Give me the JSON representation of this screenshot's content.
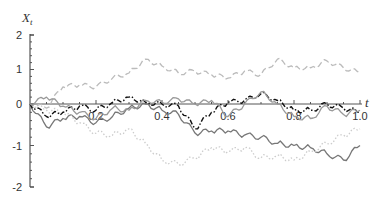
{
  "chart_data": {
    "type": "line",
    "title": "",
    "xlabel": "t",
    "ylabel": "X_t",
    "ylabel_main": "X",
    "ylabel_sub": "t",
    "xlim": [
      0,
      1.0
    ],
    "ylim": [
      -2,
      2
    ],
    "x_ticks": [
      "0.2",
      "0.4",
      "0.6",
      "0.8",
      "1.0"
    ],
    "y_ticks": [
      "2",
      "1",
      "0",
      "-1",
      "-2"
    ],
    "grid": false,
    "legend": "none",
    "x": [
      0,
      0.05,
      0.1,
      0.15,
      0.2,
      0.25,
      0.3,
      0.35,
      0.4,
      0.45,
      0.5,
      0.55,
      0.6,
      0.65,
      0.7,
      0.75,
      0.8,
      0.85,
      0.9,
      0.95,
      1.0
    ],
    "series": [
      {
        "name": "path-1",
        "style": "dashed",
        "color": "#bbbbbb",
        "values": [
          0.0,
          -0.1,
          0.5,
          0.55,
          0.5,
          0.75,
          0.9,
          1.3,
          1.1,
          0.9,
          0.95,
          0.85,
          0.75,
          0.95,
          0.85,
          1.3,
          1.05,
          1.05,
          1.25,
          1.05,
          0.9
        ]
      },
      {
        "name": "path-2",
        "style": "solid",
        "color": "#777777",
        "values": [
          0.0,
          -0.55,
          -0.35,
          -0.3,
          -0.45,
          -0.3,
          -0.1,
          0.0,
          -0.15,
          -0.25,
          -0.7,
          -0.65,
          -0.65,
          -0.75,
          -0.8,
          -0.95,
          -1.0,
          -1.05,
          -1.2,
          -1.35,
          -1.0
        ]
      },
      {
        "name": "path-3",
        "style": "dotted",
        "color": "#cccccc",
        "values": [
          0.0,
          -0.15,
          -0.2,
          -0.45,
          -0.7,
          -0.75,
          -0.6,
          -0.95,
          -1.35,
          -1.45,
          -1.3,
          -1.05,
          -1.15,
          -1.05,
          -1.3,
          -1.25,
          -1.35,
          -1.15,
          -0.95,
          -0.75,
          -0.6
        ]
      },
      {
        "name": "path-4",
        "style": "dash-dot",
        "color": "#111111",
        "values": [
          0.0,
          -0.3,
          -0.2,
          -0.05,
          -0.15,
          0.05,
          0.2,
          0.05,
          0.0,
          -0.05,
          -0.6,
          -0.2,
          0.05,
          0.1,
          0.3,
          0.1,
          -0.15,
          -0.15,
          0.0,
          -0.1,
          -0.2
        ]
      },
      {
        "name": "path-5",
        "style": "solid",
        "color": "#999999",
        "values": [
          0.0,
          0.2,
          -0.05,
          -0.2,
          -0.35,
          -0.1,
          -0.15,
          0.1,
          0.05,
          0.15,
          0.0,
          0.1,
          -0.3,
          0.0,
          0.35,
          0.0,
          -0.3,
          -0.35,
          -0.05,
          -0.25,
          -0.15
        ]
      }
    ]
  }
}
